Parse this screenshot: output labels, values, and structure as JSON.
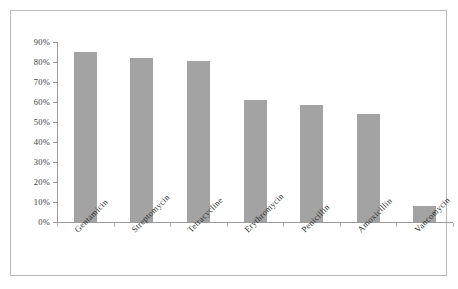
{
  "chart_data": {
    "type": "bar",
    "title": "",
    "subtitle": "",
    "xlabel": "",
    "ylabel": "",
    "categories": [
      "Gentamicin",
      "Streptomycin",
      "Tetracycline",
      "Erythromycin",
      "Penicillin",
      "Amoxicillin",
      "Vancomycin"
    ],
    "values": [
      85,
      82,
      80.5,
      61,
      58.5,
      54,
      8
    ],
    "ylim": [
      0,
      90
    ],
    "ytick_values": [
      0,
      10,
      20,
      30,
      40,
      50,
      60,
      70,
      80,
      90
    ],
    "ytick_labels": [
      "0%",
      "10%",
      "20%",
      "30%",
      "40%",
      "50%",
      "60%",
      "70%",
      "80%",
      "90%"
    ],
    "grid": false,
    "legend": null,
    "legend_position": "none",
    "value_format": "percent",
    "bar_color": "#a3a3a3",
    "axis_color": "#9a9a9a",
    "frame_color": "#b9b9b9",
    "label_rotation_deg": -45
  }
}
